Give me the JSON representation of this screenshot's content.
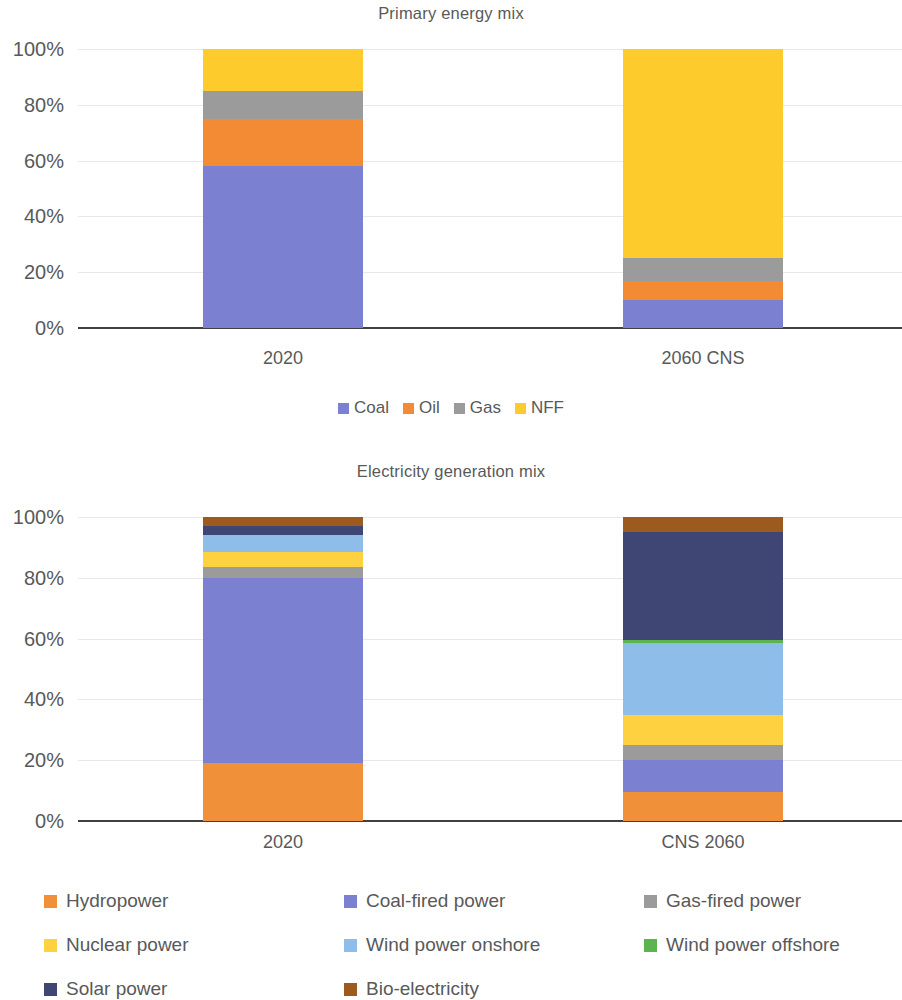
{
  "charts": [
    {
      "title": "Primary energy mix",
      "legend_position": "bottom-inline"
    },
    {
      "title": "Electricity generation mix",
      "legend_position": "bottom-grid"
    }
  ],
  "chart_data": [
    {
      "type": "bar",
      "stacked": true,
      "stack_mode": "percent",
      "title": "Primary energy mix",
      "xlabel": "",
      "ylabel": "",
      "categories": [
        "2020",
        "2060 CNS"
      ],
      "ylim": [
        0,
        100
      ],
      "yticks": [
        "0%",
        "20%",
        "40%",
        "60%",
        "80%",
        "100%"
      ],
      "ytick_values": [
        0,
        20,
        40,
        60,
        80,
        100
      ],
      "grid": true,
      "legend_position": "bottom",
      "series": [
        {
          "name": "Coal",
          "color": "#7b80d0",
          "values": [
            58,
            10
          ]
        },
        {
          "name": "Oil",
          "color": "#f28b33",
          "values": [
            17,
            7
          ]
        },
        {
          "name": "Gas",
          "color": "#9b9b9b",
          "values": [
            10,
            8
          ]
        },
        {
          "name": "NFF",
          "color": "#fdcb2b",
          "values": [
            15,
            75
          ]
        }
      ]
    },
    {
      "type": "bar",
      "stacked": true,
      "stack_mode": "percent",
      "title": "Electricity generation mix",
      "xlabel": "",
      "ylabel": "",
      "categories": [
        "2020",
        "CNS 2060"
      ],
      "ylim": [
        0,
        100
      ],
      "yticks": [
        "0%",
        "20%",
        "40%",
        "60%",
        "80%",
        "100%"
      ],
      "ytick_values": [
        0,
        20,
        40,
        60,
        80,
        100
      ],
      "grid": true,
      "legend_position": "bottom",
      "series": [
        {
          "name": "Hydropower",
          "color": "#f0913a",
          "values": [
            19.0,
            9.5
          ]
        },
        {
          "name": "Coal-fired power",
          "color": "#7b80d0",
          "values": [
            61.0,
            10.5
          ]
        },
        {
          "name": "Gas-fired power",
          "color": "#9b9b9b",
          "values": [
            3.5,
            5.0
          ]
        },
        {
          "name": "Nuclear power",
          "color": "#fdd13f",
          "values": [
            5.0,
            10.0
          ]
        },
        {
          "name": "Wind power onshore",
          "color": "#8ebdea",
          "values": [
            5.5,
            23.5
          ]
        },
        {
          "name": "Wind power offshore",
          "color": "#5bb450",
          "values": [
            0.0,
            1.0
          ]
        },
        {
          "name": "Solar power",
          "color": "#404673",
          "values": [
            3.0,
            35.5
          ]
        },
        {
          "name": "Bio-electricity",
          "color": "#9c5a1e",
          "values": [
            3.0,
            5.0
          ]
        }
      ]
    }
  ],
  "legend1": {
    "items": [
      {
        "label": "Coal",
        "color": "#7b80d0"
      },
      {
        "label": "Oil",
        "color": "#f28b33"
      },
      {
        "label": "Gas",
        "color": "#9b9b9b"
      },
      {
        "label": "NFF",
        "color": "#fdcb2b"
      }
    ]
  },
  "legend2": {
    "items": [
      {
        "label": "Hydropower",
        "color": "#f0913a"
      },
      {
        "label": "Coal-fired power",
        "color": "#7b80d0"
      },
      {
        "label": "Gas-fired power",
        "color": "#9b9b9b"
      },
      {
        "label": "Nuclear power",
        "color": "#fdd13f"
      },
      {
        "label": "Wind power onshore",
        "color": "#8ebdea"
      },
      {
        "label": "Wind power offshore",
        "color": "#5bb450"
      },
      {
        "label": "Solar power",
        "color": "#404673"
      },
      {
        "label": "Bio-electricity",
        "color": "#9c5a1e"
      }
    ]
  }
}
